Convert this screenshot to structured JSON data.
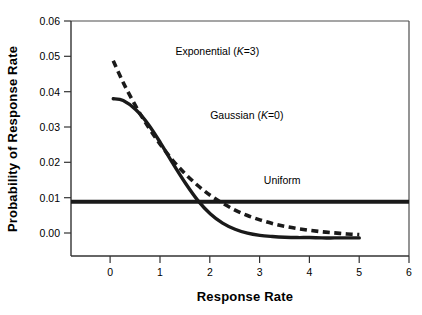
{
  "chart_data": {
    "type": "line",
    "title": "",
    "xlabel": "Response Rate",
    "ylabel": "Probability of Response Rate",
    "xlim": [
      -0.8,
      6
    ],
    "ylim": [
      -0.005,
      0.06
    ],
    "xticks": [
      0,
      1,
      2,
      3,
      4,
      5,
      6
    ],
    "xtick_labels": [
      "0",
      "1",
      "2",
      "3",
      "4",
      "5",
      "6"
    ],
    "yticks": [
      0.0,
      0.01,
      0.02,
      0.03,
      0.04,
      0.05,
      0.06
    ],
    "ytick_labels": [
      "0.00",
      "0.01",
      "0.02",
      "0.03",
      "0.04",
      "0.05",
      "0.06"
    ],
    "grid": false,
    "legend_position": "inline-annotations",
    "series": [
      {
        "name": "Exponential (K=3)",
        "label_text": "Exponential (",
        "label_italic": "K",
        "label_tail": "=3)",
        "style": "dashed",
        "color": "#1a1a1a",
        "x": [
          0.05,
          0.25,
          0.5,
          0.75,
          1.0,
          1.25,
          1.5,
          1.75,
          2.0,
          2.25,
          2.5,
          2.75,
          3.0,
          3.25,
          3.5,
          3.75,
          4.0,
          4.25,
          4.5,
          4.75,
          5.0
        ],
        "y": [
          0.049,
          0.043,
          0.0365,
          0.0308,
          0.0258,
          0.0214,
          0.0177,
          0.0145,
          0.0118,
          0.0096,
          0.0077,
          0.0062,
          0.005,
          0.004,
          0.0032,
          0.0026,
          0.0021,
          0.0017,
          0.0014,
          0.0011,
          0.0009
        ]
      },
      {
        "name": "Gaussian (K=0)",
        "label_text": "Gaussian (",
        "label_italic": "K",
        "label_tail": "=0)",
        "style": "solid",
        "color": "#1a1a1a",
        "x": [
          0.05,
          0.25,
          0.5,
          0.75,
          1.0,
          1.25,
          1.5,
          1.75,
          2.0,
          2.25,
          2.5,
          2.75,
          3.0,
          3.25,
          3.5,
          3.75,
          4.0,
          4.25,
          4.5,
          4.75,
          5.0
        ],
        "y": [
          0.0385,
          0.038,
          0.0355,
          0.0315,
          0.0263,
          0.0206,
          0.0152,
          0.0104,
          0.0067,
          0.0041,
          0.0024,
          0.0013,
          0.0007,
          0.0004,
          0.0002,
          0.0001,
          0.0001,
          0.0,
          0.0,
          0.0,
          0.0
        ]
      },
      {
        "name": "Uniform",
        "label_text": "Uniform",
        "style": "solid-thick",
        "color": "#1a1a1a",
        "x": [
          -0.8,
          6.0
        ],
        "y": [
          0.01,
          0.01
        ]
      }
    ],
    "annotations": [
      {
        "name": "exponential-label",
        "x": 1.3,
        "y": 0.0505
      },
      {
        "name": "gaussian-label",
        "x": 2.0,
        "y": 0.0328
      },
      {
        "name": "uniform-label",
        "x": 3.45,
        "y": 0.0148
      }
    ]
  }
}
